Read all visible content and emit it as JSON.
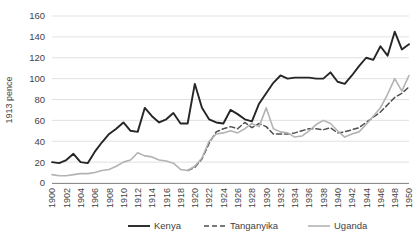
{
  "chart_data": {
    "type": "line",
    "title": "",
    "xlabel": "",
    "ylabel": "1913 pence",
    "ylim": [
      0,
      160
    ],
    "ytick_values": [
      0,
      20,
      40,
      60,
      80,
      100,
      120,
      140,
      160
    ],
    "xlim": [
      1900,
      1950
    ],
    "xtick_labels": [
      "1900",
      "1902",
      "1904",
      "1906",
      "1908",
      "1910",
      "1912",
      "1914",
      "1916",
      "1918",
      "1920",
      "1922",
      "1924",
      "1926",
      "1928",
      "1930",
      "1932",
      "1934",
      "1936",
      "1938",
      "1940",
      "1942",
      "1944",
      "1946",
      "1948",
      "1950"
    ],
    "grid": true,
    "legend_position": "bottom",
    "x": [
      1900,
      1901,
      1902,
      1903,
      1904,
      1905,
      1906,
      1907,
      1908,
      1909,
      1910,
      1911,
      1912,
      1913,
      1914,
      1915,
      1916,
      1917,
      1918,
      1919,
      1920,
      1921,
      1922,
      1923,
      1924,
      1925,
      1926,
      1927,
      1928,
      1929,
      1930,
      1931,
      1932,
      1933,
      1934,
      1935,
      1936,
      1937,
      1938,
      1939,
      1940,
      1941,
      1942,
      1943,
      1944,
      1945,
      1946,
      1947,
      1948,
      1949,
      1950
    ],
    "series": [
      {
        "name": "Kenya",
        "style": "solid",
        "color": "#262626",
        "width": 1.9,
        "values": [
          20,
          19,
          22,
          28,
          20,
          19,
          30,
          39,
          47,
          52,
          58,
          50,
          49,
          72,
          64,
          58,
          61,
          67,
          57,
          57,
          95,
          72,
          61,
          58,
          57,
          70,
          66,
          61,
          59,
          76,
          86,
          96,
          103,
          100,
          101,
          101,
          101,
          100,
          100,
          106,
          97,
          95,
          103,
          112,
          120,
          118,
          131,
          122,
          145,
          128,
          133
        ]
      },
      {
        "name": "Tanganyika",
        "style": "dashed",
        "color": "#4f4f4f",
        "width": 1.5,
        "values": [
          null,
          null,
          null,
          null,
          null,
          null,
          null,
          null,
          null,
          null,
          null,
          null,
          null,
          null,
          null,
          null,
          null,
          null,
          null,
          12,
          15,
          23,
          38,
          49,
          52,
          54,
          52,
          58,
          53,
          57,
          54,
          47,
          47,
          47,
          48,
          50,
          52,
          52,
          51,
          53,
          48,
          49,
          51,
          53,
          58,
          63,
          68,
          75,
          82,
          86,
          92
        ]
      },
      {
        "name": "Uganda",
        "style": "solid",
        "color": "#b3b3b3",
        "width": 1.6,
        "values": [
          8,
          7,
          7,
          8,
          9,
          9,
          10,
          12,
          13,
          16,
          20,
          22,
          29,
          26,
          25,
          22,
          21,
          19,
          13,
          12,
          16,
          24,
          40,
          47,
          48,
          50,
          48,
          52,
          57,
          54,
          72,
          52,
          49,
          48,
          44,
          45,
          50,
          56,
          60,
          57,
          50,
          44,
          47,
          49,
          56,
          64,
          72,
          85,
          100,
          88,
          103
        ]
      }
    ]
  },
  "legend": {
    "items": [
      {
        "label": "Kenya"
      },
      {
        "label": "Tanganyika"
      },
      {
        "label": "Uganda"
      }
    ]
  }
}
